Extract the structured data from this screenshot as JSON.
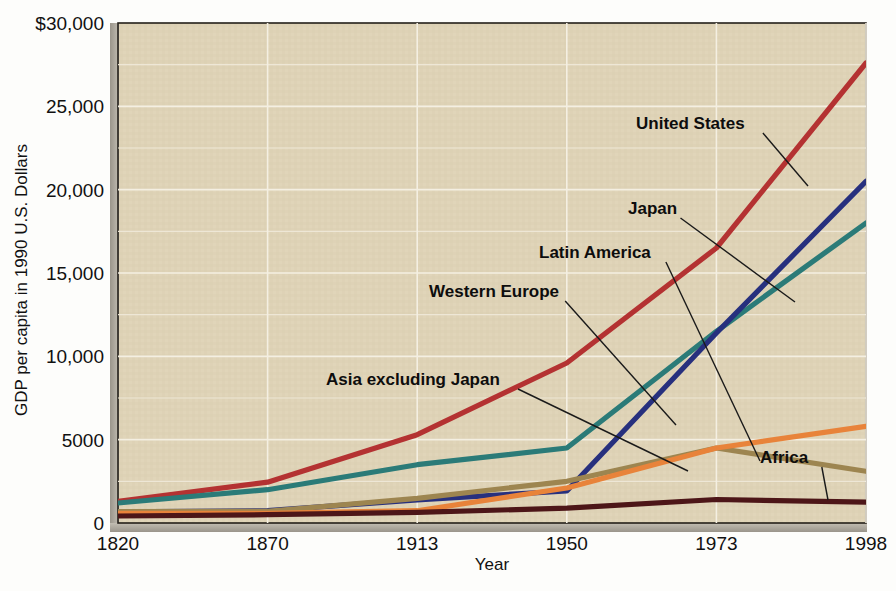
{
  "chart_data": {
    "type": "line",
    "title": "",
    "xlabel": "Year",
    "ylabel": "GDP per capita in 1990 U.S. Dollars",
    "x": [
      "1820",
      "1870",
      "1913",
      "1950",
      "1973",
      "1998"
    ],
    "xtick_labels": [
      "1820",
      "1870",
      "1913",
      "1950",
      "1973",
      "1998"
    ],
    "ytick_labels": [
      "0",
      "5000",
      "10,000",
      "15,000",
      "20,000",
      "25,000",
      "$30,000"
    ],
    "ytick_values": [
      0,
      5000,
      10000,
      15000,
      20000,
      25000,
      30000
    ],
    "ylim": [
      0,
      30000
    ],
    "grid": true,
    "legend_position": "inline-annotations",
    "plot_background": "#ded2b6",
    "series": [
      {
        "name": "United States",
        "color": "#b43232",
        "values": [
          1300,
          2450,
          5300,
          9600,
          16500,
          27600
        ]
      },
      {
        "name": "Western Europe",
        "color": "#2b7b78",
        "values": [
          1200,
          2000,
          3500,
          4500,
          11500,
          18000
        ]
      },
      {
        "name": "Japan",
        "color": "#27307e",
        "values": [
          670,
          740,
          1390,
          1920,
          11400,
          20500
        ]
      },
      {
        "name": "Latin America",
        "color": "#9d8550",
        "values": [
          690,
          700,
          1480,
          2500,
          4500,
          3100
        ]
      },
      {
        "name": "Asia excluding Japan",
        "color": "#e8833a",
        "values": [
          575,
          580,
          740,
          2100,
          4500,
          5800
        ]
      },
      {
        "name": "Africa",
        "color": "#4d1618",
        "values": [
          420,
          500,
          640,
          890,
          1410,
          1250
        ]
      }
    ],
    "annotations": [
      {
        "label": "United States",
        "text_x": 636,
        "text_y": 129,
        "leader_to_x": 808,
        "leader_to_y": 186
      },
      {
        "label": "Japan",
        "text_x": 628,
        "text_y": 214,
        "leader_to_x": 795,
        "leader_to_y": 302
      },
      {
        "label": "Latin America",
        "text_x": 539,
        "text_y": 258,
        "leader_to_x": 760,
        "leader_to_y": 461
      },
      {
        "label": "Western Europe",
        "text_x": 429,
        "text_y": 297,
        "leader_to_x": 676,
        "leader_to_y": 425
      },
      {
        "label": "Asia excluding Japan",
        "text_x": 326,
        "text_y": 385,
        "leader_to_x": 688,
        "leader_to_y": 471
      },
      {
        "label": "Africa",
        "text_x": 760,
        "text_y": 463,
        "leader_to_x": 828,
        "leader_to_y": 500
      }
    ]
  },
  "axis": {
    "y_title": "GDP per capita in 1990 U.S. Dollars",
    "x_title": "Year"
  }
}
